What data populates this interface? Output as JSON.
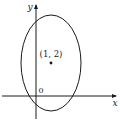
{
  "diagram": {
    "type": "ellipse-on-axes",
    "axes": {
      "x_label": "x",
      "y_label": "y",
      "origin_label": "0"
    },
    "ellipse": {
      "center_label": "(1, 2)"
    },
    "colors": {
      "stroke": "#1a1a1a",
      "background": "#ffffff"
    }
  }
}
